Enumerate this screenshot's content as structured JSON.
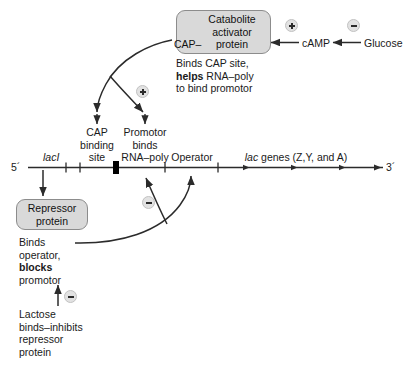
{
  "figure": {
    "background": "#ffffff",
    "box_fill": "#d9d9d9",
    "box_stroke": "#8c8c8c",
    "line_color": "#2b2b2b",
    "badge_fill": "#e2e2e2"
  },
  "cap_box": {
    "line1": "Catabolite",
    "line2": "activator",
    "line3": "protein",
    "prefix": "CAP–"
  },
  "cap_note": {
    "line1": "Binds CAP site,",
    "line2_bold": "helps",
    "line2_rest": " RNA–poly",
    "line3": "to bind promotor"
  },
  "camp_pathway": {
    "camp_label": "cAMP",
    "glucose_label": "Glucose",
    "camp_sign": "+",
    "glucose_sign": "–"
  },
  "dna": {
    "five_prime": "5´",
    "three_prime": "3´",
    "lacI_label": "lacI",
    "cap_site_label": {
      "line1": "CAP",
      "line2": "binding",
      "line3": "site"
    },
    "promotor_label": {
      "line1": "Promotor",
      "line2": "binds",
      "line3": "RNA–poly"
    },
    "operator_label": "Operator",
    "genes_label_italic": "lac",
    "genes_label_rest": " genes (Z,Y, and A)"
  },
  "signs": {
    "cap_positive": "+",
    "repressor_negative": "–",
    "lactose_negative": "–"
  },
  "repressor_box": {
    "line1": "Repressor",
    "line2": "protein"
  },
  "repressor_note": {
    "line1": "Binds",
    "line2": "operator,",
    "line3_bold": "blocks",
    "line4": "promotor"
  },
  "lactose_note": {
    "line1": "Lactose",
    "line2": "binds–inhibits",
    "line3": "repressor",
    "line4": "protein"
  }
}
